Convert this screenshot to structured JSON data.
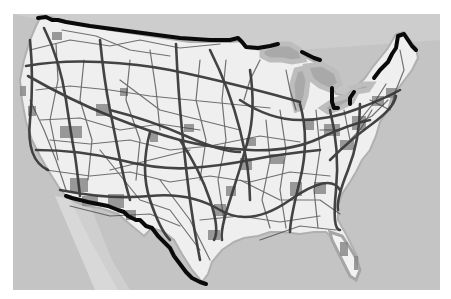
{
  "map": {
    "subject": "Contiguous United States freight / transportation network",
    "style": "grayscale",
    "colors": {
      "page_background": "#ffffff",
      "water": "#c4c4c4",
      "water_light": "#d6d6d6",
      "land": "#efefef",
      "urban_areas": "#8a8a8a",
      "routes": "#3a3a3a",
      "border": "#0a0a0a",
      "lakes": "#a9a9a9",
      "lake_halo": "#b9b9b9"
    },
    "frame": {
      "x": 13,
      "y": 14,
      "width": 427,
      "height": 276
    },
    "layers": [
      "water",
      "land",
      "urban-areas",
      "route-network",
      "international-border"
    ],
    "labels": []
  }
}
